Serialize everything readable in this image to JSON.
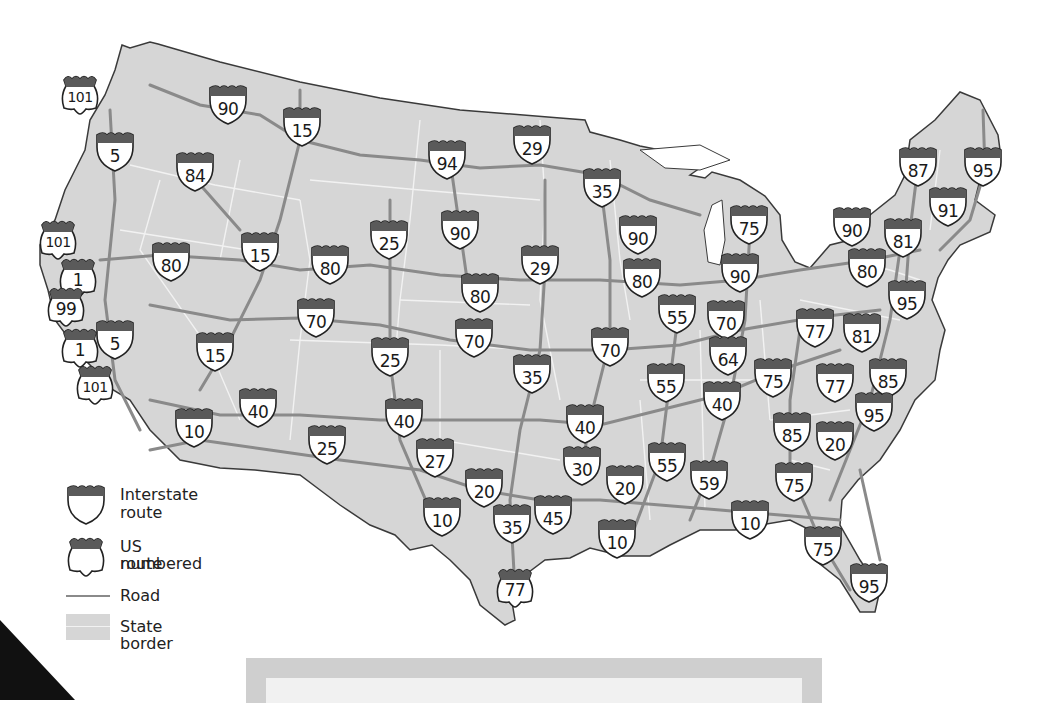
{
  "colors": {
    "land": "#d6d6d6",
    "coast_stroke": "#3a3a3a",
    "road": "#8a8a8a",
    "state_border": "#f2f2f2",
    "shield_header": "#5a5a5a",
    "shield_body": "#ffffff",
    "shield_outline": "#222222"
  },
  "legend": {
    "items": [
      {
        "icon": "interstate-shield-icon",
        "label_line1": "Interstate",
        "label_line2": "route"
      },
      {
        "icon": "us-route-shield-icon",
        "label_line1": "US numbered",
        "label_line2": "route"
      },
      {
        "icon": "road-line-icon",
        "label_line1": "Road"
      },
      {
        "icon": "state-border-swatch-icon",
        "label_line1": "State border"
      }
    ]
  },
  "interstate_shields": [
    {
      "n": "90",
      "x": 228,
      "y": 105
    },
    {
      "n": "15",
      "x": 302,
      "y": 127
    },
    {
      "n": "5",
      "x": 115,
      "y": 152
    },
    {
      "n": "84",
      "x": 195,
      "y": 172
    },
    {
      "n": "94",
      "x": 447,
      "y": 160
    },
    {
      "n": "29",
      "x": 532,
      "y": 145
    },
    {
      "n": "35",
      "x": 602,
      "y": 188
    },
    {
      "n": "87",
      "x": 918,
      "y": 167
    },
    {
      "n": "95",
      "x": 983,
      "y": 167
    },
    {
      "n": "91",
      "x": 948,
      "y": 207
    },
    {
      "n": "75",
      "x": 749,
      "y": 225
    },
    {
      "n": "90",
      "x": 852,
      "y": 227
    },
    {
      "n": "81",
      "x": 903,
      "y": 238
    },
    {
      "n": "90",
      "x": 638,
      "y": 235
    },
    {
      "n": "25",
      "x": 389,
      "y": 240
    },
    {
      "n": "90",
      "x": 460,
      "y": 230
    },
    {
      "n": "80",
      "x": 171,
      "y": 262
    },
    {
      "n": "15",
      "x": 260,
      "y": 252
    },
    {
      "n": "80",
      "x": 330,
      "y": 265
    },
    {
      "n": "29",
      "x": 540,
      "y": 265
    },
    {
      "n": "80",
      "x": 642,
      "y": 278
    },
    {
      "n": "90",
      "x": 740,
      "y": 273
    },
    {
      "n": "80",
      "x": 867,
      "y": 268
    },
    {
      "n": "95",
      "x": 907,
      "y": 300
    },
    {
      "n": "80",
      "x": 480,
      "y": 293
    },
    {
      "n": "55",
      "x": 677,
      "y": 314
    },
    {
      "n": "70",
      "x": 726,
      "y": 320
    },
    {
      "n": "70",
      "x": 316,
      "y": 318
    },
    {
      "n": "77",
      "x": 815,
      "y": 328
    },
    {
      "n": "81",
      "x": 862,
      "y": 333
    },
    {
      "n": "15",
      "x": 215,
      "y": 352
    },
    {
      "n": "5",
      "x": 115,
      "y": 340
    },
    {
      "n": "25",
      "x": 390,
      "y": 357
    },
    {
      "n": "70",
      "x": 474,
      "y": 338
    },
    {
      "n": "70",
      "x": 610,
      "y": 347
    },
    {
      "n": "64",
      "x": 728,
      "y": 356
    },
    {
      "n": "75",
      "x": 773,
      "y": 378
    },
    {
      "n": "77",
      "x": 835,
      "y": 383
    },
    {
      "n": "85",
      "x": 888,
      "y": 378
    },
    {
      "n": "35",
      "x": 532,
      "y": 374
    },
    {
      "n": "55",
      "x": 666,
      "y": 383
    },
    {
      "n": "40",
      "x": 722,
      "y": 401
    },
    {
      "n": "40",
      "x": 258,
      "y": 408
    },
    {
      "n": "10",
      "x": 194,
      "y": 428
    },
    {
      "n": "40",
      "x": 404,
      "y": 418
    },
    {
      "n": "40",
      "x": 585,
      "y": 424
    },
    {
      "n": "85",
      "x": 792,
      "y": 432
    },
    {
      "n": "95",
      "x": 874,
      "y": 412
    },
    {
      "n": "20",
      "x": 835,
      "y": 441
    },
    {
      "n": "25",
      "x": 327,
      "y": 445
    },
    {
      "n": "27",
      "x": 435,
      "y": 458
    },
    {
      "n": "30",
      "x": 582,
      "y": 466
    },
    {
      "n": "55",
      "x": 667,
      "y": 462
    },
    {
      "n": "20",
      "x": 625,
      "y": 485
    },
    {
      "n": "59",
      "x": 709,
      "y": 480
    },
    {
      "n": "75",
      "x": 794,
      "y": 482
    },
    {
      "n": "20",
      "x": 484,
      "y": 488
    },
    {
      "n": "10",
      "x": 442,
      "y": 517
    },
    {
      "n": "35",
      "x": 512,
      "y": 524
    },
    {
      "n": "45",
      "x": 553,
      "y": 515
    },
    {
      "n": "10",
      "x": 617,
      "y": 539
    },
    {
      "n": "10",
      "x": 750,
      "y": 520
    },
    {
      "n": "75",
      "x": 823,
      "y": 546
    },
    {
      "n": "95",
      "x": 869,
      "y": 583
    }
  ],
  "us_shields": [
    {
      "n": "101",
      "x": 80,
      "y": 95
    },
    {
      "n": "101",
      "x": 58,
      "y": 240
    },
    {
      "n": "1",
      "x": 78,
      "y": 278
    },
    {
      "n": "99",
      "x": 66,
      "y": 307
    },
    {
      "n": "1",
      "x": 80,
      "y": 348
    },
    {
      "n": "101",
      "x": 95,
      "y": 385
    },
    {
      "n": "77",
      "x": 515,
      "y": 588
    }
  ]
}
